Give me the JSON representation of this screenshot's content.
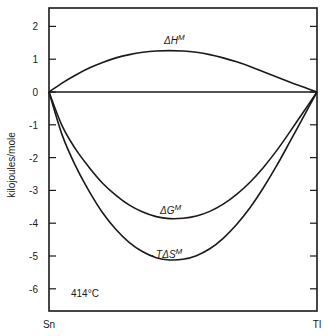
{
  "chart_data": {
    "type": "line",
    "title": "",
    "xlabel": "",
    "ylabel": "kilojoules/mole",
    "ylim": [
      -6.6,
      2.55
    ],
    "xlim": [
      0,
      1
    ],
    "x_tick_labels": {
      "left": "Sn",
      "right": "Tl"
    },
    "y_ticks": [
      2,
      1,
      0,
      -1,
      -2,
      -3,
      -4,
      -5,
      -6
    ],
    "y_tick_labels": [
      "2",
      "1",
      "0",
      "-1",
      "-2",
      "-3",
      "-4",
      "-5",
      "-6"
    ],
    "grid": false,
    "annotation": "414°C",
    "x": [
      0,
      0.05,
      0.1,
      0.15,
      0.2,
      0.25,
      0.3,
      0.35,
      0.4,
      0.45,
      0.5,
      0.55,
      0.6,
      0.65,
      0.7,
      0.75,
      0.8,
      0.85,
      0.9,
      0.95,
      1.0
    ],
    "series": [
      {
        "name": "ΔH^M",
        "label_main": "ΔH",
        "label_sup": "M",
        "values": [
          0,
          0.28,
          0.52,
          0.73,
          0.9,
          1.04,
          1.14,
          1.21,
          1.25,
          1.26,
          1.25,
          1.21,
          1.14,
          1.04,
          0.92,
          0.78,
          0.62,
          0.46,
          0.3,
          0.15,
          0
        ]
      },
      {
        "name": "ΔG^M",
        "label_main": "ΔG",
        "label_sup": "M",
        "values": [
          0,
          -1.05,
          -1.75,
          -2.3,
          -2.78,
          -3.15,
          -3.45,
          -3.66,
          -3.8,
          -3.86,
          -3.85,
          -3.78,
          -3.64,
          -3.42,
          -3.12,
          -2.75,
          -2.3,
          -1.78,
          -1.2,
          -0.6,
          0
        ]
      },
      {
        "name": "-TΔS^M",
        "label_main": "- TΔS",
        "label_sup": "M",
        "values": [
          0,
          -1.33,
          -2.27,
          -3.03,
          -3.68,
          -4.19,
          -4.59,
          -4.87,
          -5.05,
          -5.12,
          -5.1,
          -4.99,
          -4.78,
          -4.46,
          -4.04,
          -3.53,
          -2.92,
          -2.24,
          -1.5,
          -0.75,
          0
        ]
      }
    ]
  }
}
